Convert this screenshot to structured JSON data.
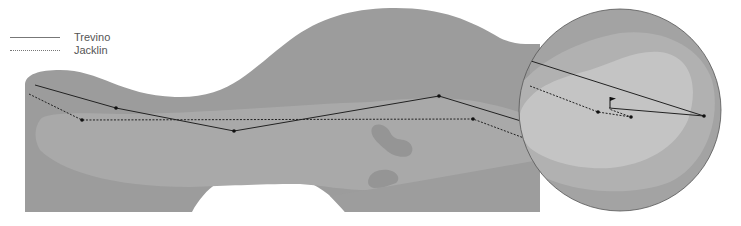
{
  "legend": {
    "items": [
      {
        "label": "Trevino",
        "style": "solid"
      },
      {
        "label": "Jacklin",
        "style": "dotted"
      }
    ]
  },
  "colors": {
    "rough": "#9c9c9c",
    "fairway": "#a9a9a9",
    "bunker": "#959595",
    "inset_outer": "#a3a3a3",
    "inset_middle": "#b1b1b1",
    "green": "#c4c4c4",
    "line": "#222222"
  },
  "players": [
    {
      "name": "Trevino",
      "style": "solid",
      "fairway_path": [
        [
          35,
          85
        ],
        [
          116,
          108
        ],
        [
          234,
          131
        ],
        [
          439,
          96
        ],
        [
          521,
          121
        ]
      ],
      "inset_path": [
        [
          531,
          61
        ],
        [
          704,
          116
        ],
        [
          609,
          108
        ]
      ]
    },
    {
      "name": "Jacklin",
      "style": "dotted",
      "fairway_path": [
        [
          29,
          94
        ],
        [
          82,
          120
        ],
        [
          473,
          119
        ],
        [
          524,
          138
        ]
      ],
      "inset_path": [
        [
          530,
          86
        ],
        [
          598,
          112
        ],
        [
          631,
          117
        ],
        [
          609,
          109
        ]
      ]
    }
  ],
  "inset": {
    "cx": 620,
    "cy": 110,
    "r": 101
  },
  "flag": {
    "x": 610,
    "top": 97,
    "bottom": 108
  }
}
